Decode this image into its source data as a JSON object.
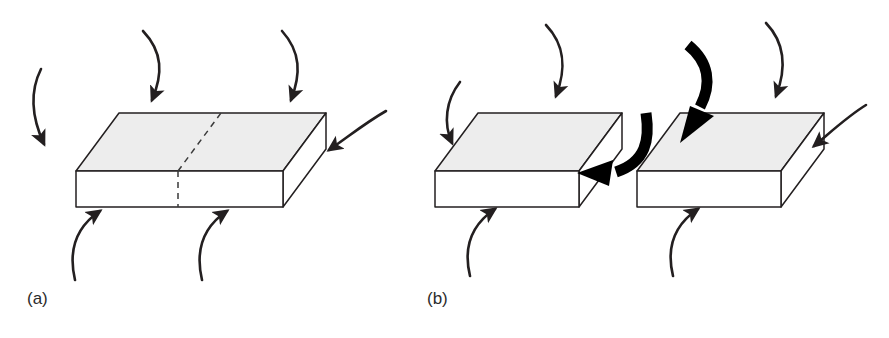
{
  "figure": {
    "background_color": "#ffffff",
    "stroke_color": "#231f20",
    "top_face_fill": "#ededed",
    "front_face_fill": "#ffffff",
    "side_face_fill": "#ffffff",
    "thick_arrow_color": "#000000",
    "dashed_line_color": "#3a3a3a"
  },
  "panels": [
    {
      "id": "a",
      "label": "(a)",
      "caption_text": "(a)",
      "description": "Intact rectangular block with dashed potential fracture plane, loaded by eight thin curved arrows",
      "block": {
        "name": "intact-block",
        "faces": [
          "top",
          "front",
          "right"
        ],
        "fracture_plane": "dashed",
        "split": false
      },
      "arrow_count_thin": 6,
      "arrow_count_thick": 0
    },
    {
      "id": "b",
      "label": "(b)",
      "caption_text": "(b)",
      "description": "Block separated into two halves along the fracture plane, with two bold arrows showing shear displacement",
      "blocks": [
        {
          "name": "left-half-block",
          "faces": [
            "top",
            "front",
            "right"
          ],
          "split": true
        },
        {
          "name": "right-half-block",
          "faces": [
            "top",
            "front",
            "right"
          ],
          "split": true
        }
      ],
      "arrow_count_thin": 6,
      "arrow_count_thick": 2
    }
  ],
  "arrows": {
    "thin_label": "load arrow",
    "thick_label": "shear displacement arrow"
  }
}
